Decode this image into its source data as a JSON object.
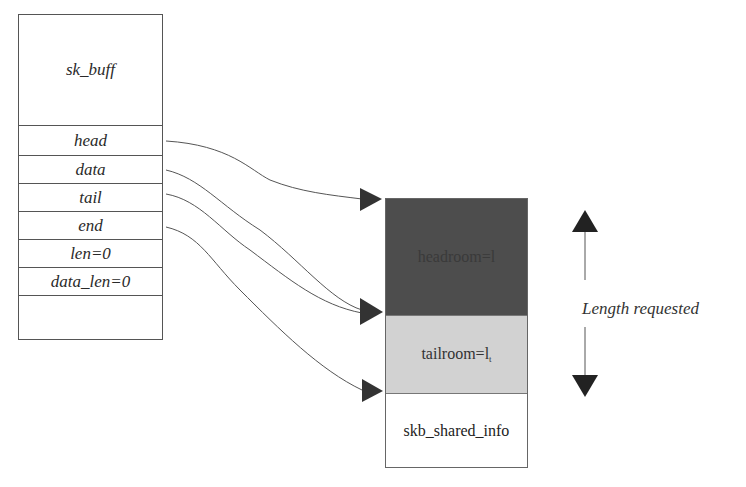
{
  "sk_buff": {
    "title": "sk_buff",
    "fields": [
      {
        "label": "head",
        "points_to": "headroom_top"
      },
      {
        "label": "data",
        "points_to": "tailroom_top"
      },
      {
        "label": "tail",
        "points_to": "tailroom_top"
      },
      {
        "label": "end",
        "points_to": "shared_info_top"
      },
      {
        "label": "len=0"
      },
      {
        "label": "data_len=0"
      },
      {
        "label": ""
      }
    ]
  },
  "buffer": {
    "headroom": {
      "label": "headroom=l",
      "color": "#4d4d4d"
    },
    "tailroom": {
      "label": "tailroom=l",
      "subscript": "t",
      "color": "#d2d2d2"
    },
    "shared_info": {
      "label": "skb_shared_info",
      "color": "#ffffff"
    }
  },
  "annotation": {
    "label": "Length requested"
  }
}
